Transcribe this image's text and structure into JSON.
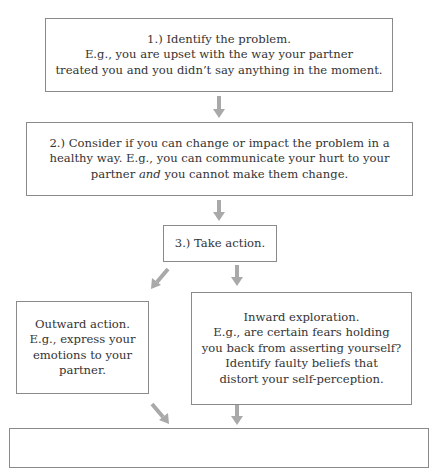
{
  "flowchart": {
    "colors": {
      "border": "#8a8a8a",
      "arrow": "#a9a9a9",
      "text": "#333333"
    },
    "step1": {
      "lines": [
        "1.) Identify the problem.",
        "E.g., you are upset with the way your partner",
        "treated you and you didn’t say anything in the moment."
      ]
    },
    "step2": {
      "line1": "2.) Consider if you can change or impact the problem in a",
      "line2": "healthy way. E.g., you can communicate your hurt to your",
      "line3_pre": "partner ",
      "line3_em": "and",
      "line3_post": " you cannot make them change."
    },
    "step3": {
      "lines": [
        "3.) Take action."
      ]
    },
    "outward": {
      "lines": [
        "Outward action.",
        "E.g., express your",
        "emotions to your",
        "partner."
      ]
    },
    "inward": {
      "lines": [
        "Inward exploration.",
        "E.g., are certain fears holding",
        "you back from asserting yourself?",
        "Identify faulty beliefs that",
        "distort your self-perception."
      ]
    },
    "arrows": [
      {
        "from": "step1",
        "to": "step2",
        "direction": "down",
        "icon": "arrow-down-icon"
      },
      {
        "from": "step2",
        "to": "step3",
        "direction": "down",
        "icon": "arrow-down-icon"
      },
      {
        "from": "step3",
        "to": "outward",
        "direction": "down-left",
        "icon": "arrow-down-left-icon"
      },
      {
        "from": "step3",
        "to": "inward",
        "direction": "down",
        "icon": "arrow-down-icon"
      },
      {
        "from": "outward",
        "to": "result",
        "direction": "down-right",
        "icon": "arrow-down-right-icon"
      },
      {
        "from": "inward",
        "to": "result",
        "direction": "down",
        "icon": "arrow-down-icon"
      }
    ]
  }
}
